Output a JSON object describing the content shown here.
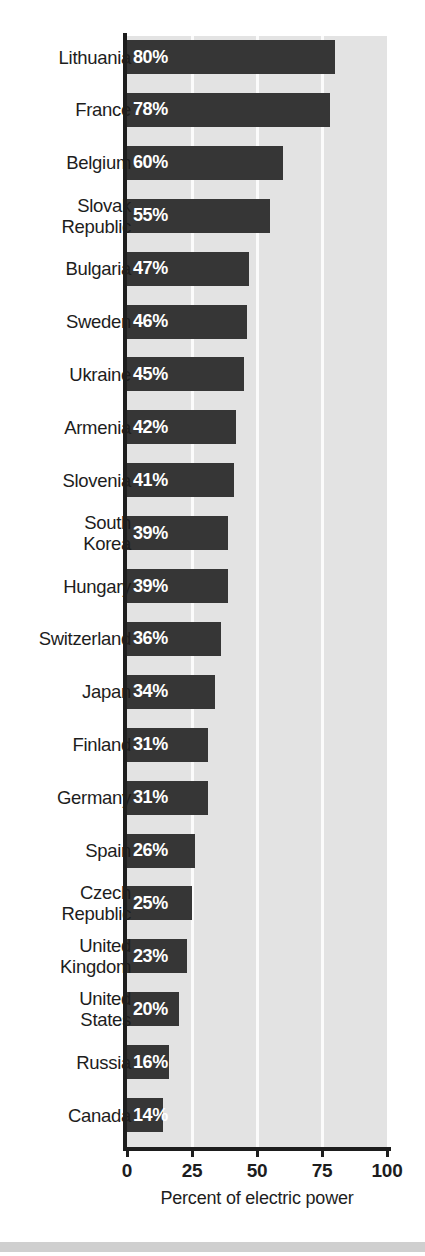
{
  "chart_data": {
    "type": "bar",
    "orientation": "horizontal",
    "title": "",
    "xlabel": "Percent of electric power",
    "ylabel": "",
    "xlim": [
      0,
      100
    ],
    "xticks": [
      0,
      25,
      50,
      75,
      100
    ],
    "xtick_labels": [
      "0",
      "25",
      "50",
      "75",
      "100"
    ],
    "grid": true,
    "grid_axis": "x",
    "legend": false,
    "bar_color": "#363636",
    "plot_background": "#e3e3e3",
    "gridline_color": "#fbfbfb",
    "value_label_color": "#ffffff",
    "value_suffix": "%",
    "categories": [
      "Lithuania",
      "France",
      "Belgium",
      "Slovak\nRepublic",
      "Bulgaria",
      "Sweden",
      "Ukraine",
      "Armenia",
      "Slovenia",
      "South\nKorea",
      "Hungary",
      "Switzerland",
      "Japan",
      "Finland",
      "Germany",
      "Spain",
      "Czech\nRepublic",
      "United\nKingdom",
      "United\nStates",
      "Russia",
      "Canada"
    ],
    "values": [
      80,
      78,
      60,
      55,
      47,
      46,
      45,
      42,
      41,
      39,
      39,
      36,
      34,
      31,
      31,
      26,
      25,
      23,
      20,
      16,
      14
    ],
    "value_labels": [
      "80%",
      "78%",
      "60%",
      "55%",
      "47%",
      "46%",
      "45%",
      "42%",
      "41%",
      "39%",
      "39%",
      "36%",
      "34%",
      "31%",
      "31%",
      "26%",
      "25%",
      "23%",
      "20%",
      "16%",
      "14%"
    ]
  },
  "top_clipped_text": ""
}
